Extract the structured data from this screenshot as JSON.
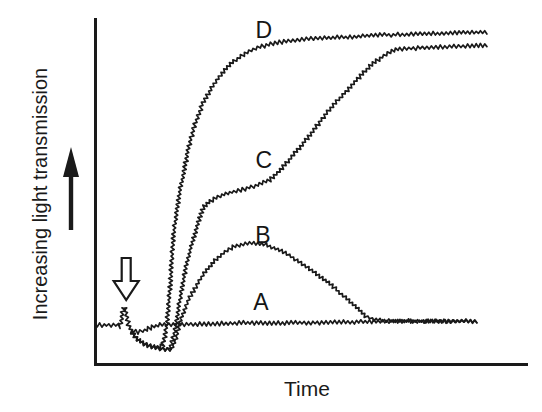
{
  "figure": {
    "background_color": "#ffffff",
    "ink_color": "#1a1a1a",
    "y_axis_label": "Increasing light transmission",
    "x_axis_label": "Time",
    "icons": {
      "direction_arrow": "solid up-arrow next to y-axis label indicating direction of increase",
      "stimulus_arrow": "open (hollow) down-arrow above baseline marking addition event"
    }
  },
  "chart_data": {
    "type": "line",
    "title": "",
    "xlabel": "Time",
    "ylabel": "Increasing light transmission",
    "axes_note": "qualitative unlabeled axes; values are relative units 0-100",
    "xlim": [
      0,
      100
    ],
    "ylim": [
      0,
      100
    ],
    "grid": false,
    "legend_position": "inline curve letters",
    "stimulus_arrow_x": 7.2,
    "series": [
      {
        "name": "A",
        "label_pos": [
          38.3,
          18.4
        ],
        "noise_px": 2.3,
        "points": [
          [
            0,
            11.8
          ],
          [
            5.3,
            11.8
          ],
          [
            5.8,
            11.2
          ],
          [
            6.7,
            17.2
          ],
          [
            7.6,
            12.6
          ],
          [
            8.3,
            10.1
          ],
          [
            9.9,
            9.8
          ],
          [
            11.5,
            10.3
          ],
          [
            13.2,
            11.2
          ],
          [
            15,
            11.8
          ],
          [
            24.2,
            12.1
          ],
          [
            35.8,
            12.4
          ],
          [
            47.3,
            12.4
          ],
          [
            58.9,
            12.6
          ],
          [
            70.4,
            12.9
          ],
          [
            88.2,
            12.9
          ]
        ]
      },
      {
        "name": "B",
        "label_pos": [
          38.8,
          37.6
        ],
        "noise_px": 2.0,
        "points": [
          [
            8.3,
            10.1
          ],
          [
            9.5,
            8
          ],
          [
            10.9,
            6.6
          ],
          [
            12.7,
            5.7
          ],
          [
            14.5,
            5.2
          ],
          [
            16.2,
            4.6
          ],
          [
            17.8,
            4.9
          ],
          [
            18.7,
            8
          ],
          [
            19.6,
            12.6
          ],
          [
            20.8,
            16.7
          ],
          [
            21.9,
            19.8
          ],
          [
            23.6,
            23.3
          ],
          [
            25.2,
            26.7
          ],
          [
            27.3,
            29.9
          ],
          [
            29.6,
            32.5
          ],
          [
            31.9,
            34.2
          ],
          [
            34.2,
            35.1
          ],
          [
            36.7,
            35.3
          ],
          [
            39,
            35.1
          ],
          [
            41.3,
            33.9
          ],
          [
            43.9,
            32.5
          ],
          [
            46.2,
            30.7
          ],
          [
            49.2,
            28.2
          ],
          [
            52,
            25.6
          ],
          [
            54.3,
            23.6
          ],
          [
            56.6,
            21
          ],
          [
            58.9,
            18.4
          ],
          [
            60.7,
            16.4
          ],
          [
            62.4,
            14.4
          ],
          [
            64,
            13.5
          ],
          [
            65.8,
            13.2
          ],
          [
            70.4,
            12.9
          ],
          [
            77.4,
            12.9
          ],
          [
            84.3,
            12.9
          ],
          [
            88.2,
            12.9
          ]
        ]
      },
      {
        "name": "C",
        "label_pos": [
          39,
          59.2
        ],
        "noise_px": 2.2,
        "points": [
          [
            8.3,
            10.1
          ],
          [
            9.5,
            8
          ],
          [
            10.9,
            6.6
          ],
          [
            12.7,
            5.7
          ],
          [
            14.5,
            5.2
          ],
          [
            16.2,
            4.6
          ],
          [
            17.3,
            5.2
          ],
          [
            18,
            7.5
          ],
          [
            18.7,
            11.8
          ],
          [
            19.6,
            19
          ],
          [
            20.6,
            25.6
          ],
          [
            21.5,
            31
          ],
          [
            22.6,
            36.2
          ],
          [
            23.8,
            41.4
          ],
          [
            24.9,
            45.4
          ],
          [
            26.6,
            47.4
          ],
          [
            28.9,
            48.9
          ],
          [
            31.6,
            50
          ],
          [
            34.6,
            50.9
          ],
          [
            37.6,
            52
          ],
          [
            40.4,
            53.4
          ],
          [
            43.2,
            56.9
          ],
          [
            46.2,
            61.2
          ],
          [
            49.7,
            66.4
          ],
          [
            53.1,
            72.1
          ],
          [
            56.6,
            77
          ],
          [
            60,
            81.6
          ],
          [
            63.5,
            86.2
          ],
          [
            66.3,
            88.8
          ],
          [
            68.6,
            90.5
          ],
          [
            70.4,
            91.1
          ],
          [
            75.1,
            91.4
          ],
          [
            80.8,
            91.7
          ],
          [
            86.6,
            92
          ],
          [
            90.5,
            92.2
          ]
        ]
      },
      {
        "name": "D",
        "label_pos": [
          39,
          96.6
        ],
        "noise_px": 2.2,
        "points": [
          [
            8.3,
            10.1
          ],
          [
            9.5,
            8
          ],
          [
            10.9,
            6.6
          ],
          [
            12.7,
            5.7
          ],
          [
            14.5,
            5.2
          ],
          [
            15.7,
            6
          ],
          [
            16.4,
            10.3
          ],
          [
            17.1,
            19
          ],
          [
            17.6,
            27.6
          ],
          [
            18,
            34.8
          ],
          [
            18.7,
            43.4
          ],
          [
            19.6,
            50
          ],
          [
            20.8,
            57.8
          ],
          [
            21.9,
            64.4
          ],
          [
            23.3,
            70.1
          ],
          [
            24.9,
            75.6
          ],
          [
            27,
            79.9
          ],
          [
            29.3,
            84.2
          ],
          [
            32.1,
            87.6
          ],
          [
            35.1,
            90.2
          ],
          [
            38.1,
            91.7
          ],
          [
            41.6,
            92.8
          ],
          [
            46.2,
            93.7
          ],
          [
            52,
            94.3
          ],
          [
            58.9,
            94.5
          ],
          [
            65.8,
            95.1
          ],
          [
            75.1,
            95.4
          ],
          [
            83.1,
            95.7
          ],
          [
            90.5,
            96
          ]
        ]
      }
    ]
  }
}
